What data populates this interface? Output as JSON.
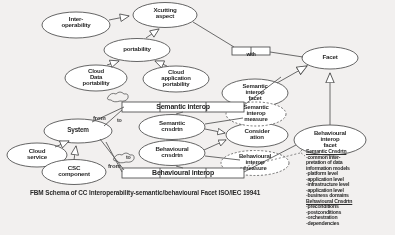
{
  "caption": "FBM Schema of CC Interoperability-semantic/behavioural Facet ISO/IEC 19941",
  "nodes": {
    "interoperability": "Inter-\noperability",
    "xcutting_aspect": "Xcutting\naspect",
    "portability": "portability",
    "cloud_data_portability": "Cloud\nData\nportability",
    "cloud_application_portability": "Cloud\napplication\nportability",
    "facet": "Facet",
    "semantic_interop_facet": "Semantic\ninterop\nfacet",
    "semantic_interop_measure": "Semantic\ninterop\nmeasure",
    "consideration": "Consider\nation",
    "behavioural_interop_measure": "Behavioural\ninterop\nmeasure",
    "behavioural_interop_facet": "Behavioural\ninterop\nfacet",
    "system": "System",
    "cloud_service": "Cloud\nservice",
    "csc_component": "CSC\ncomponent",
    "semantic_cnsdrtn": "Semantic\ncnsdrtn",
    "behavioural_cnsdrtn": "Behavioural\ncnsdrtn"
  },
  "associations": {
    "with": "with",
    "semantic_interop": "Semantic interop",
    "behavioural_interop": "Behavioural interop"
  },
  "edge_labels": {
    "from_top": "from",
    "to_top": "to",
    "from_bottom": "from",
    "to_bottom": "to"
  },
  "notes": {
    "semantic_header": "Semantic Cnsdrtn",
    "semantic_items": [
      "-common inter-",
      "pretation of data",
      "information models",
      "-platform level",
      "-application level",
      "-infrastructure level",
      "-application level",
      "-business domains"
    ],
    "behavioural_header": "Behavioural Cnsdrtn",
    "behavioural_items": [
      "-preconditions",
      "-postconditions",
      "-orchestration",
      "-dependencies"
    ]
  },
  "colors": {
    "background": "#f2f0ef",
    "stroke": "#4a4a4a",
    "text": "#2b2b2b",
    "node_fill": "#ffffff"
  }
}
